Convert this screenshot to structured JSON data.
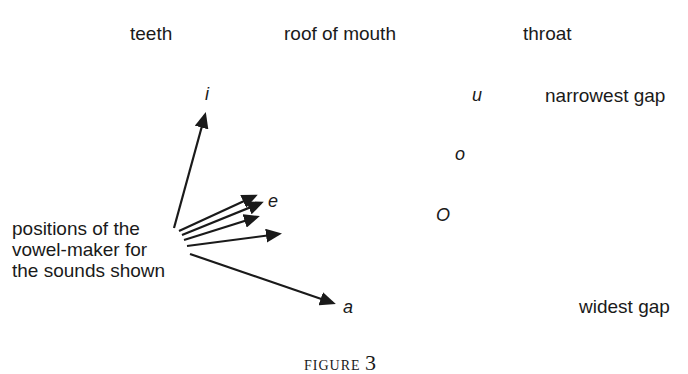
{
  "header": {
    "columns": [
      "teeth",
      "roof of mouth",
      "throat"
    ]
  },
  "scale": {
    "top": "narrowest gap",
    "bottom": "widest gap"
  },
  "vowels": {
    "i": "i",
    "e": "e",
    "a": "a",
    "u": "u",
    "o_small": "o",
    "o_open": "O"
  },
  "annotation": {
    "line1": "positions of the",
    "line2": "vowel-maker for",
    "line3": "the sounds shown"
  },
  "caption": {
    "word": "FIGURE",
    "number": "3"
  },
  "colors": {
    "ink": "#1a1a1a",
    "background": "#ffffff"
  }
}
